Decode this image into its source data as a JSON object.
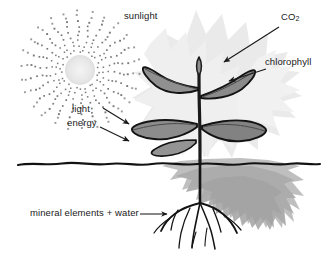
{
  "figure": {
    "background_color": "#ffffff"
  },
  "labels": {
    "sunlight": "sunlight",
    "co2_text": "CO",
    "co2_sub": "2",
    "chlorophyll": "chlorophyll",
    "light": "light",
    "energy": "energy",
    "minerals": "mineral elements  +  water"
  },
  "colors": {
    "ink": "#1a1a1a",
    "leaf_fill": "#8e8e8e",
    "leaf_fill_light": "#a8a8a8",
    "halo": "#dcdcdc",
    "soil": "#b5b5b5",
    "sun_disc": "#ececec",
    "ray_dot": "#6b6b6b",
    "ground_line": "#141414"
  },
  "elements": {
    "sun": "sun-with-radiating-dots",
    "plant": "plant-with-stem-and-leaves",
    "roots": "root-system",
    "ground": "ground-line",
    "soil_blob": "soil-region",
    "halo": "light-halo-behind-plant",
    "arrow_co2": "arrow-co2-to-plant",
    "arrow_chlorophyll": "arrow-chlorophyll-to-leaf",
    "arrow_light_1": "arrow-light-energy-upper",
    "arrow_light_2": "arrow-light-energy-lower",
    "arrow_minerals": "arrow-minerals-to-roots"
  }
}
